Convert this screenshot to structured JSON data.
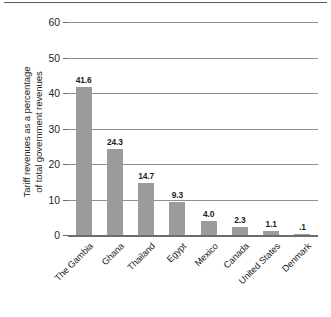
{
  "chart_data": {
    "type": "bar",
    "title": "",
    "subtitle": "",
    "xlabel": "",
    "ylabel": "Tariff revenues as a percentage of total government revenues",
    "ylabel_line1": "Tariff revenues as a percentage",
    "ylabel_line2": "of total government revenues",
    "categories": [
      "The Gambia",
      "Ghana",
      "Thailand",
      "Egypt",
      "Mexico",
      "Canada",
      "United States",
      "Denmark"
    ],
    "values": [
      41.6,
      24.3,
      14.7,
      9.3,
      4.0,
      2.3,
      1.1,
      0.1
    ],
    "value_labels": [
      "41.6",
      "24.3",
      "14.7",
      "9.3",
      "4.0",
      "2.3",
      "1.1",
      ".1"
    ],
    "ylim": [
      0,
      60
    ],
    "ytick_values": [
      0,
      10,
      20,
      30,
      40,
      50,
      60
    ],
    "ytick_labels": [
      "0",
      "10",
      "20",
      "30",
      "40",
      "50",
      "60"
    ],
    "grid": true,
    "grid_axis": "y",
    "legend": false,
    "legend_position": "none",
    "bar_color": "#9b9b9b",
    "gridline_color": "#8f8f8f",
    "axis_color": "#6d6d6d",
    "text_color": "#231f20",
    "background_color": "#ffffff"
  }
}
